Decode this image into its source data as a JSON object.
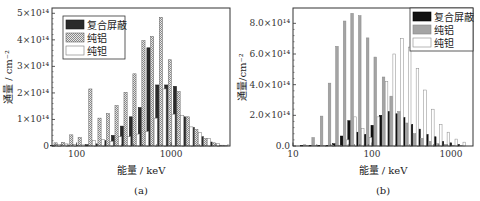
{
  "chart_data": [
    {
      "type": "bar",
      "panel": "a",
      "caption": "(a)",
      "title": "",
      "xlabel": "能量 / keV",
      "ylabel": "通量 / cm⁻²",
      "xscale": "log",
      "xlim": [
        55,
        4200
      ],
      "ylim": [
        0,
        520000000000000.0
      ],
      "xticks": [
        {
          "value": 100,
          "label": "100"
        },
        {
          "value": 1000,
          "label": "1000"
        }
      ],
      "yticks": [
        {
          "value": 0,
          "label": "0"
        },
        {
          "value": 100000000000000.0,
          "label": "1×10¹⁴"
        },
        {
          "value": 200000000000000.0,
          "label": "2×10¹⁴"
        },
        {
          "value": 300000000000000.0,
          "label": "3×10¹⁴"
        },
        {
          "value": 400000000000000.0,
          "label": "4×10¹⁴"
        },
        {
          "value": 500000000000000.0,
          "label": "5×10¹⁴"
        }
      ],
      "legend_position": "top-left",
      "x": [
        60,
        72,
        88,
        108,
        140,
        175,
        215,
        265,
        330,
        410,
        510,
        630,
        780,
        970,
        1200,
        1500,
        1850,
        2300,
        2850,
        3500
      ],
      "series": [
        {
          "name": "复合屏蔽",
          "style": "dark",
          "values": [
            2000000000000.0,
            3000000000000.0,
            2000000000000.0,
            3000000000000.0,
            5000000000000.0,
            8000000000000.0,
            20000000000000.0,
            40000000000000.0,
            75000000000000.0,
            110000000000000.0,
            145000000000000.0,
            370000000000000.0,
            230000000000000.0,
            230000000000000.0,
            225000000000000.0,
            110000000000000.0,
            70000000000000.0,
            35000000000000.0,
            15000000000000.0,
            3000000000000.0
          ]
        },
        {
          "name": "纯铝",
          "style": "hatched",
          "values": [
            12000000000000.0,
            14000000000000.0,
            42000000000000.0,
            32000000000000.0,
            215000000000000.0,
            105000000000000.0,
            122000000000000.0,
            152000000000000.0,
            202000000000000.0,
            272000000000000.0,
            397000000000000.0,
            413000000000000.0,
            485000000000000.0,
            325000000000000.0,
            205000000000000.0,
            110000000000000.0,
            62000000000000.0,
            28000000000000.0,
            12000000000000.0,
            3000000000000.0
          ]
        },
        {
          "name": "纯钽",
          "style": "white",
          "values": [
            5000000000000.0,
            8000000000000.0,
            5000000000000.0,
            4000000000000.0,
            20000000000000.0,
            25000000000000.0,
            18000000000000.0,
            35000000000000.0,
            35000000000000.0,
            45000000000000.0,
            55000000000000.0,
            105000000000000.0,
            215000000000000.0,
            120000000000000.0,
            115000000000000.0,
            72000000000000.0,
            50000000000000.0,
            28000000000000.0,
            10000000000000.0,
            2000000000000.0
          ]
        }
      ]
    },
    {
      "type": "bar",
      "panel": "b",
      "caption": "(b)",
      "title": "",
      "xlabel": "能量 / keV",
      "ylabel": "通量/cm⁻²",
      "xscale": "log",
      "xlim": [
        10,
        1900
      ],
      "ylim": [
        0,
        900000000000000.0
      ],
      "xticks": [
        {
          "value": 10,
          "label": "10"
        },
        {
          "value": 100,
          "label": "100"
        },
        {
          "value": 1000,
          "label": "1000"
        }
      ],
      "yticks": [
        {
          "value": 0,
          "label": "0.0"
        },
        {
          "value": 200000000000000.0,
          "label": "2.0×10¹⁴"
        },
        {
          "value": 400000000000000.0,
          "label": "4.0×10¹⁴"
        },
        {
          "value": 600000000000000.0,
          "label": "6.0×10¹⁴"
        },
        {
          "value": 800000000000000.0,
          "label": "8.0×10¹⁴"
        }
      ],
      "legend_position": "top-right",
      "x": [
        14,
        18,
        23,
        29,
        36,
        45,
        56,
        70,
        88,
        110,
        140,
        175,
        220,
        275,
        345,
        430,
        540,
        680,
        850,
        1070,
        1350
      ],
      "series": [
        {
          "name": "复合屏蔽",
          "style": "black",
          "values": [
            0.0,
            0.0,
            0.0,
            0.0,
            15000000000000.0,
            65000000000000.0,
            165000000000000.0,
            90000000000000.0,
            75000000000000.0,
            135000000000000.0,
            200000000000000.0,
            225000000000000.0,
            210000000000000.0,
            185000000000000.0,
            140000000000000.0,
            110000000000000.0,
            75000000000000.0,
            60000000000000.0,
            30000000000000.0,
            20000000000000.0,
            10000000000000.0
          ]
        },
        {
          "name": "纯铝",
          "style": "gray",
          "values": [
            8000000000000.0,
            55000000000000.0,
            195000000000000.0,
            410000000000000.0,
            650000000000000.0,
            815000000000000.0,
            865000000000000.0,
            850000000000000.0,
            705000000000000.0,
            580000000000000.0,
            450000000000000.0,
            325000000000000.0,
            225000000000000.0,
            150000000000000.0,
            80000000000000.0,
            50000000000000.0,
            30000000000000.0,
            15000000000000.0,
            10000000000000.0,
            5000000000000.0,
            2000000000000.0
          ]
        },
        {
          "name": "纯钽",
          "style": "white",
          "values": [
            0.0,
            0.0,
            0.0,
            0.0,
            5000000000000.0,
            40000000000000.0,
            190000000000000.0,
            115000000000000.0,
            55000000000000.0,
            190000000000000.0,
            420000000000000.0,
            600000000000000.0,
            700000000000000.0,
            645000000000000.0,
            505000000000000.0,
            365000000000000.0,
            240000000000000.0,
            140000000000000.0,
            90000000000000.0,
            45000000000000.0,
            25000000000000.0
          ]
        }
      ]
    }
  ]
}
